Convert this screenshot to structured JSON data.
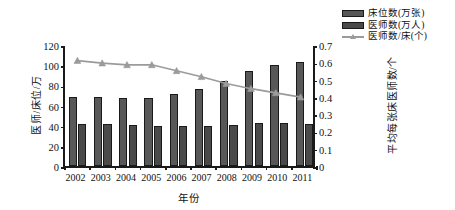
{
  "chart_data": {
    "type": "bar",
    "title": "",
    "subtitle": "",
    "xlabel": "年份",
    "ylabel": "医师/床位/万",
    "ylabel_right": "平均每张床医师数/个",
    "categories": [
      "2002",
      "2003",
      "2004",
      "2005",
      "2006",
      "2007",
      "2008",
      "2009",
      "2010",
      "2011"
    ],
    "ylim": [
      0,
      120
    ],
    "yticks": [
      0,
      20,
      40,
      60,
      80,
      100,
      120
    ],
    "ytick_labels": [
      "0",
      "20",
      "40",
      "60",
      "80",
      "100",
      "120"
    ],
    "ylim_right": [
      0,
      0.7
    ],
    "yticks_right": [
      0,
      0.1,
      0.2,
      0.3,
      0.4,
      0.5,
      0.6,
      0.7
    ],
    "ytick_labels_right": [
      "0",
      "0.1",
      "0.2",
      "0.3",
      "0.4",
      "0.5",
      "0.6",
      "0.7"
    ],
    "grid": false,
    "legend_position": "top-right",
    "series": [
      {
        "name": "床位数(万张)",
        "kind": "bar",
        "axis": "left",
        "color": "#585858",
        "values": [
          68,
          68,
          67,
          67,
          71,
          76,
          84,
          94,
          100,
          103
        ]
      },
      {
        "name": "医师数(万人)",
        "kind": "bar",
        "axis": "left",
        "color": "#4a4a4a",
        "values": [
          42,
          42,
          41,
          40,
          40,
          40,
          41,
          43,
          43,
          42
        ]
      },
      {
        "name": "医师数/床(个)",
        "kind": "line",
        "axis": "right",
        "color": "#9b9b9b",
        "marker": "triangle",
        "values": [
          0.62,
          0.605,
          0.595,
          0.595,
          0.56,
          0.525,
          0.485,
          0.455,
          0.43,
          0.405
        ]
      }
    ]
  },
  "legend": {
    "items": [
      {
        "label": "床位数(万张)",
        "swatch": "bar-beds-swatch"
      },
      {
        "label": "医师数(万人)",
        "swatch": "bar-docs-swatch"
      },
      {
        "label": "医师数/床(个)",
        "swatch": "line-marker-swatch"
      }
    ]
  },
  "axes": {
    "left_title": "医师/床位/万",
    "right_title": "平均每张床医师数/个",
    "x_title": "年份"
  }
}
